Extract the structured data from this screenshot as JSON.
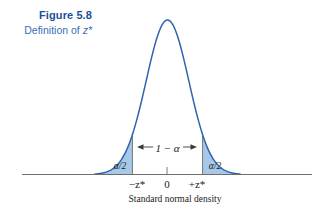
{
  "caption": {
    "title": "Figure 5.8",
    "subtitle_prefix": "Definition of ",
    "subtitle_symbol": "z*"
  },
  "colors": {
    "title": "#1b4f9c",
    "subtitle": "#3a6fb5",
    "curve": "#2e64ae",
    "fill": "#a8c8e8",
    "axis": "#6d6d6d",
    "text": "#1a1a1a"
  },
  "chart_data": {
    "type": "line",
    "title": "Standard normal density",
    "xlabel": "Standard normal density",
    "ylabel": "",
    "x_tick_labels": [
      "−z*",
      "0",
      "+z*"
    ],
    "x_tick_values": [
      -1.645,
      0,
      1.645
    ],
    "xlim": [
      -3.4,
      3.4
    ],
    "ylim": [
      0,
      0.42
    ],
    "grid": false,
    "legend": false,
    "annotations": [
      {
        "text": "α/2",
        "region": "left-tail",
        "x": -2.1,
        "y": 0.045
      },
      {
        "text": "α/2",
        "region": "right-tail",
        "x": 2.1,
        "y": 0.045
      },
      {
        "text": "1 − α",
        "region": "center",
        "x": 0,
        "y": 0.105
      }
    ],
    "shaded_regions": [
      {
        "name": "left-tail",
        "from": -3.4,
        "to": -1.645,
        "label": "α/2"
      },
      {
        "name": "right-tail",
        "from": 1.645,
        "to": 3.4,
        "label": "α/2"
      }
    ],
    "series": [
      {
        "name": "Standard normal density",
        "function": "normal-pdf",
        "mean": 0,
        "sd": 1
      }
    ]
  },
  "labels": {
    "left_tail": "α/2",
    "right_tail": "α/2",
    "interval": "1 − α",
    "tick_left": "−z*",
    "tick_center": "0",
    "tick_right": "+z*",
    "xaxis_title": "Standard normal density"
  }
}
